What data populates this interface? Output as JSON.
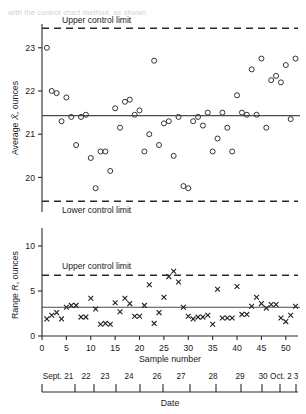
{
  "figure": {
    "caption_faint": "with the control chart method, as shown",
    "xbar_axis_title": "Average X, ounces",
    "r_axis_title": "Range R, ounces",
    "sample_axis_title": "Sample number",
    "date_axis_title": "Date",
    "upper_limit_label": "Upper control limit",
    "lower_limit_label": "Lower control limit",
    "ink": "#1a1a1a"
  },
  "chart_data": [
    {
      "type": "scatter",
      "name": "xbar-chart",
      "title": "",
      "xlabel": "Sample number",
      "ylabel": "Average X, ounces",
      "xlim": [
        0,
        52.5
      ],
      "ylim": [
        19.2,
        23.55
      ],
      "grid": false,
      "legend": "none",
      "marker": "open-circle",
      "xticks": [
        0,
        5,
        10,
        15,
        20,
        25,
        30,
        35,
        40,
        45,
        50
      ],
      "yticks": [
        20,
        21,
        22,
        23
      ],
      "center_line": 21.43,
      "upper_control_limit": 23.45,
      "lower_control_limit": 19.45,
      "x": [
        1,
        2,
        3,
        4,
        5,
        6,
        7,
        8,
        9,
        10,
        11,
        12,
        13,
        14,
        15,
        16,
        17,
        18,
        19,
        20,
        21,
        22,
        23,
        24,
        25,
        26,
        27,
        28,
        29,
        30,
        31,
        32,
        33,
        34,
        35,
        36,
        37,
        38,
        39,
        40,
        41,
        42,
        43,
        44,
        45,
        46,
        47,
        48,
        49,
        50,
        51,
        52
      ],
      "values": [
        23.0,
        22.0,
        21.95,
        21.3,
        21.85,
        21.4,
        20.75,
        21.4,
        21.45,
        20.45,
        19.75,
        20.6,
        20.6,
        20.15,
        21.6,
        21.15,
        21.75,
        21.8,
        21.45,
        21.55,
        20.6,
        21.0,
        22.7,
        20.75,
        21.25,
        21.3,
        20.5,
        21.4,
        19.8,
        19.75,
        21.3,
        21.4,
        21.2,
        21.5,
        20.6,
        20.9,
        21.5,
        21.15,
        20.6,
        21.9,
        21.5,
        21.45,
        22.5,
        21.45,
        22.75,
        21.15,
        22.25,
        22.35,
        22.2,
        22.6,
        21.35,
        22.75
      ]
    },
    {
      "type": "scatter",
      "name": "r-chart",
      "title": "",
      "xlabel": "Sample number",
      "ylabel": "Range R, ounces",
      "xlim": [
        0,
        52.5
      ],
      "ylim": [
        0,
        12.0
      ],
      "grid": false,
      "legend": "none",
      "marker": "x",
      "xticks": [
        0,
        5,
        10,
        15,
        20,
        25,
        30,
        35,
        40,
        45,
        50
      ],
      "yticks": [
        0,
        5,
        10
      ],
      "center_line": 3.2,
      "upper_control_limit": 6.75,
      "x": [
        1,
        2,
        3,
        4,
        5,
        6,
        7,
        8,
        9,
        10,
        11,
        12,
        13,
        14,
        15,
        16,
        17,
        18,
        19,
        20,
        21,
        22,
        23,
        24,
        25,
        26,
        27,
        28,
        29,
        30,
        31,
        32,
        33,
        34,
        35,
        36,
        37,
        38,
        39,
        40,
        41,
        42,
        43,
        44,
        45,
        46,
        47,
        48,
        49,
        50,
        51,
        52
      ],
      "values": [
        1.9,
        2.3,
        2.6,
        1.9,
        3.2,
        3.4,
        3.4,
        2.1,
        2.1,
        4.2,
        3.0,
        1.3,
        1.4,
        1.3,
        3.7,
        2.7,
        4.2,
        3.6,
        2.2,
        2.2,
        3.4,
        5.7,
        1.4,
        2.6,
        4.3,
        6.6,
        7.2,
        6.0,
        3.2,
        2.2,
        1.9,
        2.1,
        2.1,
        2.3,
        1.3,
        5.2,
        2.0,
        2.0,
        2.0,
        5.5,
        2.4,
        2.4,
        3.3,
        4.3,
        3.6,
        3.1,
        3.5,
        3.5,
        2.0,
        1.6,
        2.3,
        3.3
      ]
    }
  ],
  "xbar_ticks": [
    {
      "label": "23",
      "value": 23
    },
    {
      "label": "22",
      "value": 22
    },
    {
      "label": "21",
      "value": 21
    },
    {
      "label": "20",
      "value": 20
    }
  ],
  "r_ticks": [
    {
      "label": "10",
      "value": 10
    },
    {
      "label": "5",
      "value": 5
    },
    {
      "label": "0",
      "value": 0
    }
  ],
  "sample_ticks": [
    {
      "label": "0",
      "value": 0
    },
    {
      "label": "5",
      "value": 5
    },
    {
      "label": "10",
      "value": 10
    },
    {
      "label": "15",
      "value": 15
    },
    {
      "label": "20",
      "value": 20
    },
    {
      "label": "25",
      "value": 25
    },
    {
      "label": "30",
      "value": 30
    },
    {
      "label": "35",
      "value": 35
    },
    {
      "label": "40",
      "value": 40
    },
    {
      "label": "45",
      "value": 45
    },
    {
      "label": "50",
      "value": 50
    }
  ],
  "date_axis": {
    "labels": [
      "Sept. 21",
      "22",
      "23",
      "24",
      "26",
      "27",
      "28",
      "29",
      "30",
      "Oct. 2",
      "3"
    ],
    "label_x": [
      58,
      86,
      105,
      129,
      157,
      181,
      213,
      240,
      263,
      281,
      296
    ],
    "tick_x": [
      42,
      75,
      94,
      116,
      140,
      163,
      190,
      216,
      241,
      262,
      280,
      296
    ],
    "title": "Date"
  }
}
